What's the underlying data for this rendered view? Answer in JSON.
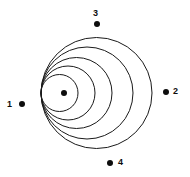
{
  "figure": {
    "title": "",
    "background_color": "#ffffff",
    "stroke_color": "#1a1a1a",
    "dot_color": "#0d0d0d"
  },
  "chart_data": {
    "type": "scatter",
    "title": "",
    "xlabel": "",
    "ylabel": "",
    "grid": false,
    "legend_position": "none",
    "xlim": [
      0,
      190
    ],
    "ylim": [
      0,
      177
    ],
    "tangency_point": {
      "x": 41,
      "y": 93
    },
    "circles": [
      {
        "name": "circle-1",
        "cx": 59.5,
        "cy": 93,
        "r": 18.5
      },
      {
        "name": "circle-2",
        "cx": 68,
        "cy": 93,
        "r": 27
      },
      {
        "name": "circle-3",
        "cx": 76.5,
        "cy": 93,
        "r": 35.5
      },
      {
        "name": "circle-4",
        "cx": 87,
        "cy": 93,
        "r": 46
      },
      {
        "name": "circle-5",
        "cx": 96.5,
        "cy": 93,
        "r": 55.5
      }
    ],
    "center_dot": {
      "name": "center-dot",
      "x": 64,
      "y": 93,
      "r": 3
    },
    "points": [
      {
        "label": "1",
        "dot_x": 22,
        "dot_y": 104,
        "label_x": 7,
        "label_y": 100,
        "dot_r": 3
      },
      {
        "label": "2",
        "dot_x": 166,
        "dot_y": 92,
        "label_x": 173,
        "label_y": 87,
        "dot_r": 3
      },
      {
        "label": "3",
        "dot_x": 97,
        "dot_y": 24,
        "label_x": 93,
        "label_y": 9,
        "dot_r": 3
      },
      {
        "label": "4",
        "dot_x": 110,
        "dot_y": 163,
        "label_x": 118,
        "label_y": 158,
        "dot_r": 3
      }
    ]
  }
}
